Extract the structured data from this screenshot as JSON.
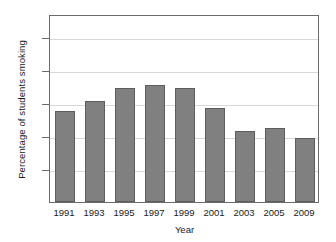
{
  "chart_data": {
    "type": "bar",
    "title": "",
    "xlabel": "Year",
    "ylabel": "Percentage of students smoking",
    "categories": [
      "1991",
      "1993",
      "1995",
      "1997",
      "1999",
      "2001",
      "2003",
      "2005",
      "2009"
    ],
    "values": [
      27.5,
      30.5,
      34.5,
      35.5,
      34.5,
      28.5,
      21.5,
      22.5,
      19.5
    ],
    "ylim": [
      0,
      57
    ],
    "yticks": [
      10,
      20,
      30,
      40,
      50
    ],
    "ytick_labels": [
      "10",
      "20",
      "30",
      "40",
      "50"
    ],
    "grid": true,
    "legend": "none",
    "bar_color": "#808080",
    "bar_edge_color": "#5d5d5d",
    "grid_color": "#d8d8d8",
    "frame_color": "#6b6b6b",
    "background": "#ffffff"
  }
}
